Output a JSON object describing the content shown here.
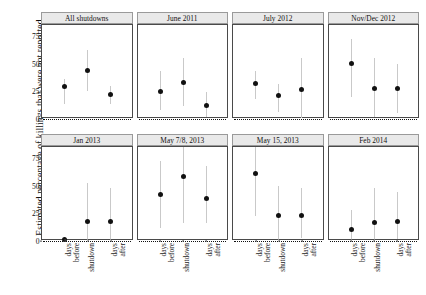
{
  "chart_data": {
    "type": "scatter",
    "title": "",
    "xlabel": "",
    "ylabel": "Estimated percentage of killings that were not reported",
    "ylim": [
      0,
      85
    ],
    "yticks": [
      0,
      25,
      50,
      75
    ],
    "ytick_labels": [
      "0",
      "25",
      "50",
      "75"
    ],
    "categories": [
      "days before",
      "shutdown",
      "days after"
    ],
    "grid": false,
    "legend": "none",
    "error_bars": "vertical confidence intervals",
    "reference_line": 0,
    "panels": [
      {
        "label": "All shutdowns",
        "row": 0,
        "col": 0,
        "values": [
          29,
          44,
          22
        ],
        "low": [
          14,
          25,
          14
        ],
        "high": [
          36,
          62,
          30
        ]
      },
      {
        "label": "June 2011",
        "row": 0,
        "col": 1,
        "values": [
          25,
          33,
          12
        ],
        "low": [
          8,
          12,
          2
        ],
        "high": [
          43,
          55,
          24
        ]
      },
      {
        "label": "July 2012",
        "row": 0,
        "col": 2,
        "values": [
          32,
          21,
          27
        ],
        "low": [
          18,
          6,
          1
        ],
        "high": [
          43,
          32,
          55
        ]
      },
      {
        "label": "Nov/Dec 2012",
        "row": 0,
        "col": 3,
        "values": [
          50,
          28,
          28
        ],
        "low": [
          20,
          2,
          5
        ],
        "high": [
          72,
          55,
          50
        ]
      },
      {
        "label": "Jan 2013",
        "row": 1,
        "col": 0,
        "values": [
          1,
          18,
          18
        ],
        "low": [
          0,
          1,
          1
        ],
        "high": [
          4,
          52,
          48
        ]
      },
      {
        "label": "May 7/8, 2013",
        "row": 1,
        "col": 1,
        "values": [
          42,
          58,
          38
        ],
        "low": [
          12,
          16,
          16
        ],
        "high": [
          72,
          85,
          68
        ]
      },
      {
        "label": "May 15, 2013",
        "row": 1,
        "col": 2,
        "values": [
          61,
          23,
          23
        ],
        "low": [
          23,
          1,
          3
        ],
        "high": [
          85,
          50,
          48
        ]
      },
      {
        "label": "Feb 2014",
        "row": 1,
        "col": 3,
        "values": [
          10,
          17,
          18
        ],
        "low": [
          1,
          1,
          2
        ],
        "high": [
          28,
          48,
          44
        ]
      }
    ]
  }
}
